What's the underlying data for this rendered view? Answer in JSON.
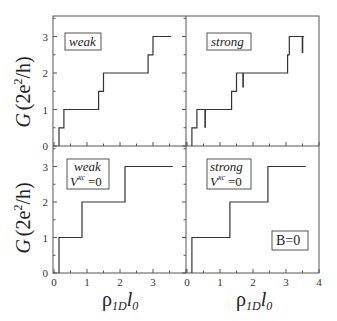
{
  "figure": {
    "ylabel": "G (2e²/h)",
    "xlabel": "ρ1D l0",
    "ylabel_parts": {
      "G": "G",
      "open": "(2e",
      "sup": "2",
      "close": "/h)"
    },
    "xlabel_parts": {
      "rho": "ρ",
      "sub1": "1D",
      "l": "l",
      "sub2": "0"
    }
  },
  "panels": {
    "top_left": {
      "label": "weak"
    },
    "top_right": {
      "label": "strong"
    },
    "bottom_left": {
      "label_line1": "weak",
      "label_line2_V": "V",
      "label_line2_sup": "xc",
      "label_line2_rest": "=0"
    },
    "bottom_right": {
      "label_line1": "strong",
      "label_line2_V": "V",
      "label_line2_sup": "xc",
      "label_line2_rest": "=0",
      "extra_label": "B=0"
    }
  },
  "ticks": {
    "y": [
      "0",
      "1",
      "2",
      "3"
    ],
    "x_left": [
      "0",
      "1",
      "2",
      "3"
    ],
    "x_right": [
      "0",
      "1",
      "2",
      "3",
      "4"
    ]
  },
  "chart_data": [
    {
      "type": "line",
      "title": "weak",
      "xlabel": "",
      "ylabel": "G (2e²/h)",
      "xlim": [
        0,
        4
      ],
      "ylim": [
        0,
        3.5
      ],
      "x": [
        0.15,
        0.15,
        0.3,
        0.3,
        1.35,
        1.35,
        1.5,
        1.5,
        2.85,
        2.85,
        3.0,
        3.0,
        3.55
      ],
      "y": [
        0,
        0.5,
        0.5,
        1.0,
        1.0,
        1.5,
        1.5,
        2.0,
        2.0,
        2.5,
        2.5,
        3.0,
        3.0
      ]
    },
    {
      "type": "line",
      "title": "strong",
      "xlabel": "",
      "ylabel": "",
      "xlim": [
        0,
        4
      ],
      "ylim": [
        0,
        3.5
      ],
      "x": [
        0.15,
        0.15,
        0.3,
        0.3,
        1.35,
        1.35,
        1.5,
        1.5,
        3.05,
        3.05,
        3.1,
        3.1,
        3.55
      ],
      "y": [
        0,
        0.5,
        0.5,
        1.0,
        1.0,
        1.5,
        1.5,
        2.0,
        2.0,
        2.5,
        2.5,
        3.0,
        3.0
      ],
      "spikes": [
        {
          "x": 0.55,
          "y_top": 1.0,
          "y_bottom": 0.5
        },
        {
          "x": 1.7,
          "y_top": 2.0,
          "y_bottom": 1.6
        },
        {
          "x": 3.5,
          "y_top": 3.0,
          "y_bottom": 2.55
        }
      ]
    },
    {
      "type": "line",
      "title": "weak Vxc=0",
      "xlabel": "ρ1D l0",
      "ylabel": "G (2e²/h)",
      "xlim": [
        0,
        4
      ],
      "ylim": [
        0,
        3.5
      ],
      "x": [
        0.15,
        0.15,
        0.85,
        0.85,
        2.15,
        2.15,
        3.6
      ],
      "y": [
        0,
        1.0,
        1.0,
        2.0,
        2.0,
        3.0,
        3.0
      ]
    },
    {
      "type": "line",
      "title": "strong Vxc=0 B=0",
      "xlabel": "ρ1D l0",
      "ylabel": "",
      "xlim": [
        0,
        4
      ],
      "ylim": [
        0,
        3.5
      ],
      "x": [
        0.15,
        0.15,
        1.3,
        1.3,
        2.45,
        2.45,
        3.6
      ],
      "y": [
        0,
        1.0,
        1.0,
        2.0,
        2.0,
        3.0,
        3.0
      ]
    }
  ]
}
